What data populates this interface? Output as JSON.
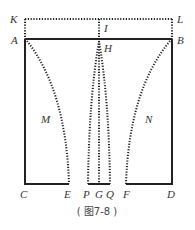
{
  "figure": {
    "caption": "( 图7-8 )",
    "labels": {
      "K": "K",
      "L": "L",
      "I": "I",
      "A": "A",
      "B": "B",
      "H": "H",
      "M": "M",
      "N": "N",
      "C": "C",
      "E": "E",
      "P": "P",
      "G": "G",
      "Q": "Q",
      "F": "F",
      "D": "D"
    },
    "line_color": "#222222"
  }
}
